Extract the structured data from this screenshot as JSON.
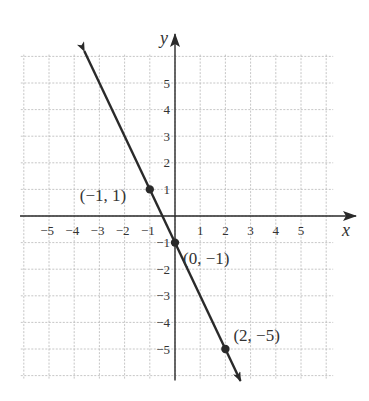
{
  "chart_data": {
    "type": "line",
    "title": "",
    "xlabel": "x",
    "ylabel": "y",
    "xlim": [
      -6,
      6
    ],
    "ylim": [
      -6,
      6
    ],
    "grid": true,
    "x_ticks": [
      -5,
      -4,
      -3,
      -2,
      -1,
      1,
      2,
      3,
      4,
      5
    ],
    "y_ticks": [
      5,
      4,
      3,
      2,
      1,
      -1,
      -2,
      -3,
      -4,
      -5
    ],
    "x_tick_labels": [
      "−5",
      "−4",
      "−3",
      "−2",
      "−1",
      "1",
      "2",
      "3",
      "4",
      "5"
    ],
    "y_tick_labels": [
      "5",
      "4",
      "3",
      "2",
      "1",
      "−1",
      "−2",
      "−3",
      "−4",
      "−5"
    ],
    "line": {
      "slope": -2,
      "intercept": -1,
      "x_range": [
        -3.6,
        2.6
      ],
      "arrows": "both"
    },
    "points": [
      {
        "x": -1,
        "y": 1,
        "label": "(−1, 1)"
      },
      {
        "x": 0,
        "y": -1,
        "label": "(0, −1)"
      },
      {
        "x": 2,
        "y": -5,
        "label": "(2, −5)"
      }
    ]
  }
}
